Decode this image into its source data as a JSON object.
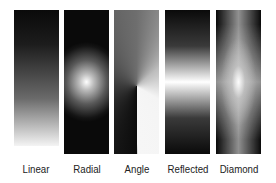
{
  "gradients": [
    {
      "type": "linear",
      "label": "Linear"
    },
    {
      "type": "radial",
      "label": "Radial"
    },
    {
      "type": "angle",
      "label": "Angle"
    },
    {
      "type": "reflected",
      "label": "Reflected"
    },
    {
      "type": "diamond",
      "label": "Diamond"
    }
  ],
  "colors": {
    "start": "#000000",
    "end": "#ffffff",
    "background": "#ffffff"
  }
}
